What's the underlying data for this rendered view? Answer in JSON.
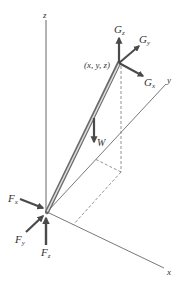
{
  "diagram": {
    "type": "3D free-body diagram",
    "axes": {
      "x": {
        "label": "x"
      },
      "y": {
        "label": "y"
      },
      "z": {
        "label": "z"
      }
    },
    "point": {
      "label": "(x, y, z)"
    },
    "forces_at_top": [
      {
        "name": "G",
        "sub": "z"
      },
      {
        "name": "G",
        "sub": "y"
      },
      {
        "name": "G",
        "sub": "x"
      }
    ],
    "weight": {
      "label": "W"
    },
    "forces_at_origin": [
      {
        "name": "F",
        "sub": "x"
      },
      {
        "name": "F",
        "sub": "y"
      },
      {
        "name": "F",
        "sub": "z"
      }
    ],
    "colors": {
      "axis": "#555555",
      "rod_light": "#d8d8d8",
      "rod_dark": "#6a6a6a",
      "arrow": "#4a4a4a",
      "dashed": "#777777",
      "text": "#333333"
    }
  }
}
